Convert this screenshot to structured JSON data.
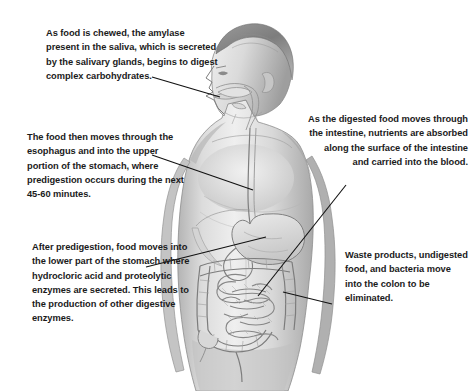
{
  "page": {
    "background_color": "#ffffff",
    "width": 476,
    "height": 391
  },
  "illustration": {
    "name": "male-figure-digestive-system",
    "description": "Grayscale pencil-style illustration of a male human figure shown from the front with the head turned in left profile, with the digestive tract visible: mouth and throat, esophagus running down the chest, stomach, small intestine and colon in the abdomen.",
    "style": "pencil-sketch-grayscale",
    "organs": [
      "mouth",
      "salivary glands",
      "throat",
      "esophagus",
      "stomach",
      "small intestine",
      "colon"
    ]
  },
  "callouts": [
    {
      "id": "amylase",
      "text": "As food is chewed, the amylase present in the saliva, which is secreted by the salivary glands, begins to digest complex carbohydrates.",
      "align": "left",
      "target": "mouth"
    },
    {
      "id": "esophagus",
      "text": "The food then moves through the esophagus and into the upper portion of the stomach, where predigestion occurs during the next 45-60 minutes.",
      "align": "left",
      "target": "esophagus"
    },
    {
      "id": "predigestion",
      "text": "After predigestion, food moves into the lower part of the stomach where hydrocloric acid and proteolytic enzymes are secreted. This leads to the production of other digestive enzymes.",
      "align": "left",
      "target": "lower-stomach"
    },
    {
      "id": "absorption",
      "text": "As the digested food moves through the intestine, nutrients are absorbed along the surface of the intestine and carried into the blood.",
      "align": "right",
      "target": "small-intestine"
    },
    {
      "id": "waste",
      "text": "Waste products, undigested food, and bacteria move into the colon to be eliminated.",
      "align": "left",
      "target": "colon"
    }
  ],
  "leader_lines": [
    {
      "id": "line-amylase",
      "from": [
        152,
        77
      ],
      "to": [
        220,
        97
      ]
    },
    {
      "id": "line-esophagus",
      "from": [
        152,
        155
      ],
      "to": [
        253,
        190
      ]
    },
    {
      "id": "line-predigestion",
      "from": [
        146,
        267
      ],
      "to": [
        266,
        237
      ]
    },
    {
      "id": "line-absorption",
      "from": [
        346,
        185
      ],
      "to": [
        258,
        296
      ]
    },
    {
      "id": "line-waste",
      "from": [
        332,
        304
      ],
      "to": [
        283,
        292
      ]
    }
  ],
  "colors": {
    "text": "#1b1b1b",
    "leader_line": "#111111",
    "skin_light": "#e8e8e8",
    "skin_mid": "#c9c9c9",
    "skin_shadow": "#9d9d9d",
    "outline": "#6e6e6e",
    "organ_fill": "#dcdcdc"
  }
}
